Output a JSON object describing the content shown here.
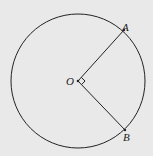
{
  "diagram": {
    "type": "geometry",
    "center": {
      "label": "O",
      "x": 78,
      "y": 81
    },
    "radius": 67,
    "points": [
      {
        "label": "A",
        "x": 124,
        "y": 30
      },
      {
        "label": "B",
        "x": 125,
        "y": 130
      }
    ],
    "segments": [
      [
        "O",
        "A"
      ],
      [
        "O",
        "B"
      ]
    ],
    "angle_marker": {
      "at": "O",
      "type": "right-angle"
    },
    "colors": {
      "background": "#e9e9e9",
      "stroke": "#222222"
    }
  }
}
